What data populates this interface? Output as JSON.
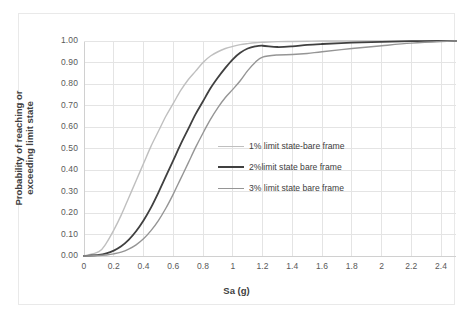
{
  "chart_data": {
    "type": "line",
    "title": "",
    "xlabel": "Sa (g)",
    "ylabel": "Probability of reaching or exceeding limit state",
    "ylabel_line1": "Probability of reaching or",
    "ylabel_line2": "exceeding limit state",
    "xlim": [
      0,
      2.5
    ],
    "ylim": [
      0,
      1.0
    ],
    "grid": true,
    "legend_position": "inside-right",
    "xticks": [
      "0",
      "0.2",
      "0.4",
      "0.6",
      "0.8",
      "1",
      "1.2",
      "1.4",
      "1.6",
      "1.8",
      "2",
      "2.2",
      "2.4"
    ],
    "xtick_values": [
      0,
      0.2,
      0.4,
      0.6,
      0.8,
      1.0,
      1.2,
      1.4,
      1.6,
      1.8,
      2.0,
      2.2,
      2.4
    ],
    "yticks": [
      "0.00",
      "0.10",
      "0.20",
      "0.30",
      "0.40",
      "0.50",
      "0.60",
      "0.70",
      "0.80",
      "0.90",
      "1.00"
    ],
    "ytick_values": [
      0,
      0.1,
      0.2,
      0.3,
      0.4,
      0.5,
      0.6,
      0.7,
      0.8,
      0.9,
      1.0
    ],
    "x": [
      0.0,
      0.1,
      0.15,
      0.2,
      0.25,
      0.3,
      0.35,
      0.4,
      0.45,
      0.5,
      0.55,
      0.6,
      0.65,
      0.7,
      0.75,
      0.8,
      0.85,
      0.9,
      0.95,
      1.0,
      1.05,
      1.1,
      1.15,
      1.2,
      1.3,
      1.4,
      1.5,
      1.6,
      1.8,
      2.0,
      2.2,
      2.4,
      2.5
    ],
    "series": [
      {
        "name": "1% limit state-bare frame",
        "color": "#bfbfbf",
        "width": 1.4,
        "values": [
          0.0,
          0.02,
          0.06,
          0.12,
          0.19,
          0.27,
          0.35,
          0.43,
          0.51,
          0.58,
          0.65,
          0.71,
          0.77,
          0.82,
          0.86,
          0.9,
          0.93,
          0.95,
          0.965,
          0.975,
          0.983,
          0.988,
          0.992,
          0.994,
          0.997,
          0.998,
          0.999,
          1.0,
          1.0,
          1.0,
          1.0,
          1.0,
          1.0
        ]
      },
      {
        "name": "2%limit state bare frame",
        "color": "#404040",
        "width": 1.8,
        "values": [
          0.0,
          0.005,
          0.012,
          0.025,
          0.045,
          0.075,
          0.115,
          0.165,
          0.225,
          0.295,
          0.37,
          0.445,
          0.52,
          0.59,
          0.66,
          0.72,
          0.78,
          0.83,
          0.875,
          0.915,
          0.945,
          0.965,
          0.975,
          0.978,
          0.972,
          0.975,
          0.982,
          0.986,
          0.992,
          0.996,
          0.999,
          1.0,
          1.0
        ]
      },
      {
        "name": "3% limit state bare frame",
        "color": "#959595",
        "width": 1.4,
        "values": [
          0.0,
          0.002,
          0.005,
          0.01,
          0.018,
          0.032,
          0.052,
          0.08,
          0.118,
          0.165,
          0.222,
          0.288,
          0.36,
          0.432,
          0.505,
          0.572,
          0.635,
          0.69,
          0.737,
          0.775,
          0.815,
          0.862,
          0.9,
          0.925,
          0.935,
          0.937,
          0.942,
          0.95,
          0.965,
          0.978,
          0.99,
          0.998,
          1.0
        ]
      }
    ]
  },
  "legend": {
    "items": [
      {
        "label": "1% limit state-bare frame",
        "color": "#bfbfbf",
        "width": 1.4
      },
      {
        "label": "2%limit state bare frame",
        "color": "#404040",
        "width": 2.0
      },
      {
        "label": "3% limit state bare frame",
        "color": "#959595",
        "width": 1.4
      }
    ]
  },
  "colors": {
    "grid": "#e4e4e4",
    "axis": "#d0d0d0",
    "text": "#595959",
    "title_text": "#404040",
    "frame_border": "#e9e9e9"
  }
}
